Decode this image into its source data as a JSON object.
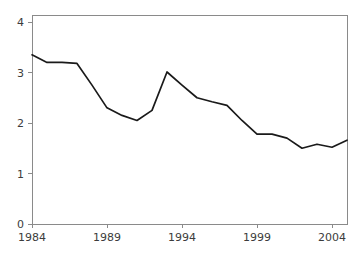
{
  "chart_data": {
    "type": "line",
    "title": "",
    "subtitle": "",
    "xlabel": "",
    "ylabel": "",
    "xlim": [
      1984,
      2005
    ],
    "ylim": [
      0,
      4
    ],
    "xticks": [
      1984,
      1989,
      1994,
      1999,
      2004
    ],
    "xtick_labels": [
      "1984",
      "1989",
      "1994",
      "1999",
      "2004"
    ],
    "yticks": [
      0,
      1,
      2,
      3,
      4
    ],
    "ytick_labels": [
      "0",
      "1",
      "2",
      "3",
      "4"
    ],
    "grid": false,
    "legend": null,
    "annotations": [],
    "series": [
      {
        "name": "series-1",
        "color": "#1a1a1a",
        "x": [
          1984,
          1985,
          1986,
          1987,
          1988,
          1989,
          1990,
          1991,
          1992,
          1993,
          1994,
          1995,
          1996,
          1997,
          1998,
          1999,
          2000,
          2001,
          2002,
          2003,
          2004,
          2005
        ],
        "values": [
          3.35,
          3.2,
          3.2,
          3.18,
          2.75,
          2.3,
          2.15,
          2.05,
          2.25,
          3.01,
          2.75,
          2.5,
          2.42,
          2.35,
          2.05,
          1.78,
          1.78,
          1.7,
          1.5,
          1.58,
          1.52,
          1.66
        ]
      }
    ]
  },
  "axes": {
    "x_axis_name": "x-axis",
    "y_axis_name": "y-axis"
  }
}
